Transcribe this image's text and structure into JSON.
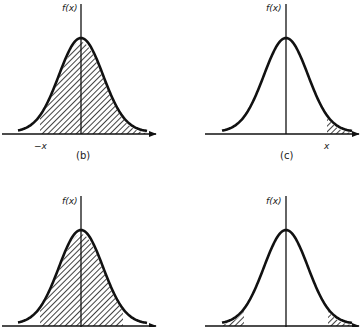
{
  "figure": {
    "colors": {
      "ink": "#111111",
      "background": "#ffffff"
    },
    "panels": [
      {
        "id": "b",
        "y_axis_label": "f(x)",
        "caption": "(b)",
        "tick_label": "−x",
        "shading": "area to the right of -x (x > -x)"
      },
      {
        "id": "c",
        "y_axis_label": "f(x)",
        "caption": "(c)",
        "tick_label": "x",
        "shading": "right tail beyond x"
      },
      {
        "id": "d",
        "y_axis_label": "f(x)",
        "caption": "",
        "tick_label": "",
        "shading": "central area between -x and x"
      },
      {
        "id": "e",
        "y_axis_label": "f(x)",
        "caption": "",
        "tick_label": "",
        "shading": "both tails beyond -x and x"
      }
    ]
  }
}
